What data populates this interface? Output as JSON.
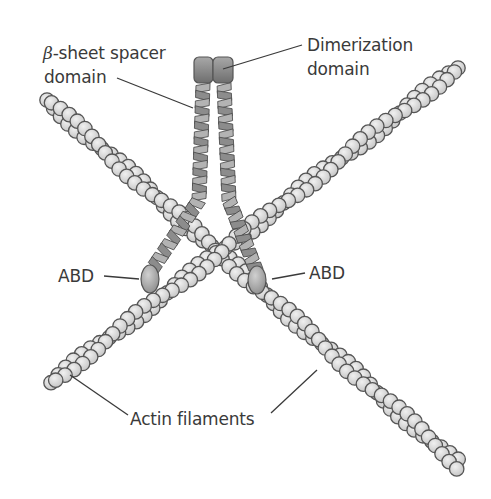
{
  "figure": {
    "labels": {
      "beta_symbol": "β",
      "spacer_line1": "-sheet spacer",
      "spacer_line2": "domain",
      "dimer_line1": "Dimerization",
      "dimer_line2": "domain",
      "abd_left": "ABD",
      "abd_right": "ABD",
      "actin": "Actin filaments"
    },
    "colors": {
      "bead_fill": "#d9d9d9",
      "bead_stroke": "#555555",
      "rod_fill": "#8c8c8c",
      "rod_light": "#b3b3b3",
      "dimer_fill": "#8a8a8a",
      "abd_fill": "#b0b0b0",
      "leader_line": "#3a3a3a",
      "text": "#3a3a3a"
    },
    "filaments": [
      {
        "name": "actin-filament-a",
        "from": [
          47,
          100
        ],
        "to": [
          462,
          468
        ]
      },
      {
        "name": "actin-filament-b",
        "from": [
          458,
          68
        ],
        "to": [
          48,
          385
        ]
      }
    ],
    "spacer_rods": [
      {
        "name": "spacer-rod-left",
        "top": [
          203,
          84
        ],
        "bend": [
          199,
          200
        ],
        "bottom": [
          153,
          268
        ]
      },
      {
        "name": "spacer-rod-right",
        "top": [
          224,
          84
        ],
        "bend": [
          229,
          200
        ],
        "bottom": [
          256,
          270
        ]
      }
    ],
    "dimer": {
      "x": 193,
      "y": 57,
      "w": 40,
      "h": 26
    },
    "abd": [
      {
        "name": "abd-left",
        "cx": 150,
        "cy": 279,
        "rx": 9,
        "ry": 14
      },
      {
        "name": "abd-right",
        "cx": 257,
        "cy": 280,
        "rx": 9,
        "ry": 14
      }
    ]
  }
}
